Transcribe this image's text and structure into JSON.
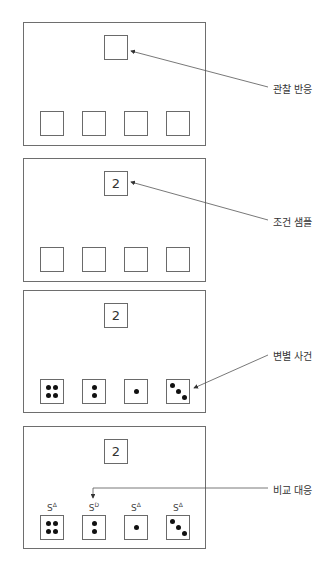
{
  "panels": [
    {
      "id": "panel-1",
      "sample_value": "",
      "comparisons": [
        "",
        "",
        "",
        ""
      ],
      "callout": "관찰 반응"
    },
    {
      "id": "panel-2",
      "sample_value": "2",
      "comparisons": [
        "",
        "",
        "",
        ""
      ],
      "callout": "조건 샘플"
    },
    {
      "id": "panel-3",
      "sample_value": "2",
      "comparisons": [
        "4 dots",
        "2 dots",
        "1 dot",
        "3 dots diagonal"
      ],
      "callout": "변별 사건"
    },
    {
      "id": "panel-4",
      "sample_value": "2",
      "comparisons": [
        "4 dots",
        "2 dots",
        "1 dot",
        "3 dots diagonal"
      ],
      "stimulus_labels": [
        {
          "base": "S",
          "sup": "Δ"
        },
        {
          "base": "S",
          "sup": "D"
        },
        {
          "base": "S",
          "sup": "Δ"
        },
        {
          "base": "S",
          "sup": "Δ"
        }
      ],
      "callout": "비교 대응"
    }
  ],
  "colors": {
    "border": "#6e6e6e",
    "dot": "#111111",
    "arrow": "#555555"
  }
}
